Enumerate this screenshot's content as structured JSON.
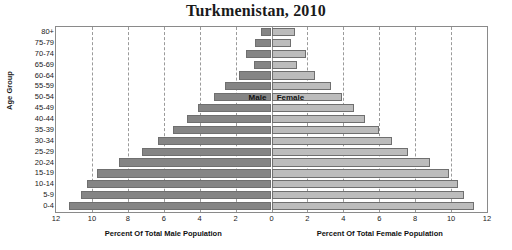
{
  "chart_data": {
    "type": "bar",
    "subtype": "population-pyramid",
    "title": "Turkmenistan, 2010",
    "ylabel": "Age Group",
    "grid": true,
    "legend_position": "center-inline",
    "categories": [
      "80+",
      "75-79",
      "70-74",
      "65-69",
      "60-64",
      "55-59",
      "50-54",
      "45-49",
      "40-44",
      "35-39",
      "30-34",
      "25-29",
      "20-24",
      "15-19",
      "10-14",
      "5-9",
      "0-4"
    ],
    "series": [
      {
        "name": "Male",
        "axis_label": "Percent Of Total Male Population",
        "xlim": [
          12,
          0
        ],
        "xticks": [
          12,
          10,
          8,
          6,
          4,
          2,
          0
        ],
        "color": "#858585",
        "values": [
          0.6,
          0.9,
          1.4,
          1.0,
          1.8,
          2.6,
          3.2,
          4.1,
          4.7,
          5.5,
          6.3,
          7.2,
          8.5,
          9.7,
          10.3,
          10.6,
          11.3
        ]
      },
      {
        "name": "Female",
        "axis_label": "Percent Of Total Female Population",
        "xlim": [
          0,
          12
        ],
        "xticks": [
          0,
          2,
          4,
          6,
          8,
          10,
          12
        ],
        "color": "#bcbcbc",
        "values": [
          1.3,
          1.1,
          1.9,
          1.4,
          2.4,
          3.3,
          3.9,
          4.6,
          5.2,
          6.0,
          6.7,
          7.6,
          8.8,
          9.9,
          10.4,
          10.7,
          11.3
        ]
      }
    ]
  },
  "legend": {
    "male": "Male",
    "female": "Female"
  },
  "colors": {
    "male_bar": "#858585",
    "female_bar": "#bcbcbc",
    "bar_border": "#6f6f6f",
    "frame": "#8a8a8a",
    "grid": "#9a9a9a",
    "text": "#1a1a1a"
  }
}
